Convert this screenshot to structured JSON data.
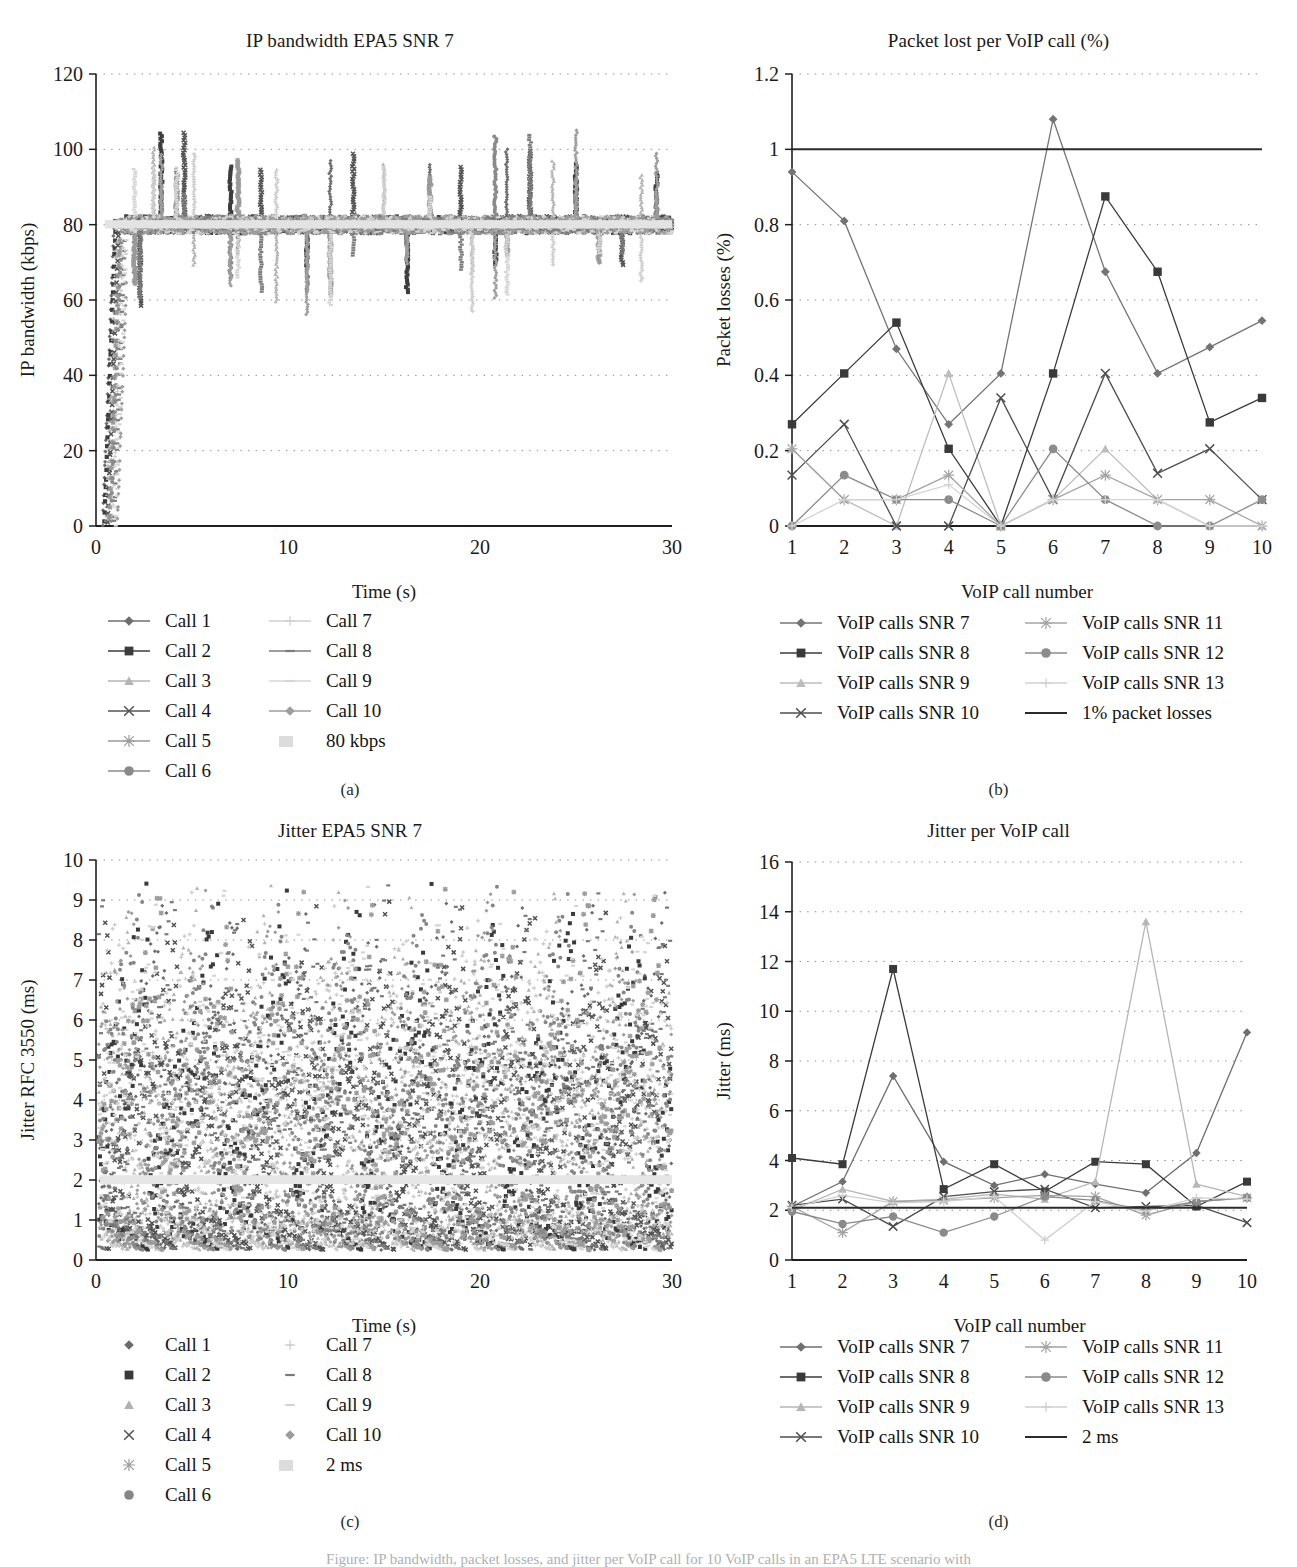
{
  "figure": {
    "subcaptions": [
      "(a)",
      "(b)",
      "(c)",
      "(d)"
    ],
    "bottom_caption": "Figure: IP bandwidth, packet losses, and jitter per VoIP call for 10 VoIP calls in an EPA5 LTE scenario with"
  },
  "chart_data": [
    {
      "id": "a",
      "type": "scatter",
      "title": "IP bandwidth EPA5 SNR 7",
      "xlabel": "Time (s)",
      "ylabel": "IP bandwidth (kbps)",
      "xlim": [
        0,
        30
      ],
      "ylim": [
        0,
        120
      ],
      "xticks": [
        0,
        10,
        20,
        30
      ],
      "yticks": [
        0,
        20,
        40,
        60,
        80,
        100,
        120
      ],
      "grid": "horizontal-dotted",
      "reference_value": 80,
      "reference_label": "80 kbps",
      "nominal_band": [
        78,
        82
      ],
      "series": [
        {
          "name": "Call 1",
          "marker": "diamond",
          "color": "#6e6e6e"
        },
        {
          "name": "Call 2",
          "marker": "square",
          "color": "#3d3d3d"
        },
        {
          "name": "Call 3",
          "marker": "triangle",
          "color": "#b4b4b4"
        },
        {
          "name": "Call 4",
          "marker": "x",
          "color": "#555555"
        },
        {
          "name": "Call 5",
          "marker": "star",
          "color": "#9a9a9a"
        },
        {
          "name": "Call 6",
          "marker": "circle",
          "color": "#8a8a8a"
        },
        {
          "name": "Call 7",
          "marker": "plus",
          "color": "#cfcfcf"
        },
        {
          "name": "Call 8",
          "marker": "dash",
          "color": "#7d7d7d"
        },
        {
          "name": "Call 9",
          "marker": "dash",
          "color": "#d6d6d6"
        },
        {
          "name": "Call 10",
          "marker": "diamond",
          "color": "#9e9e9e"
        },
        {
          "name": "80 kbps",
          "marker": "band",
          "color": "#e2e2e2"
        }
      ],
      "legend_labels": [
        "Call 1",
        "Call 2",
        "Call 3",
        "Call 4",
        "Call 5",
        "Call 6",
        "Call 7",
        "Call 8",
        "Call 9",
        "Call 10",
        "80 kbps"
      ]
    },
    {
      "id": "b",
      "type": "line",
      "title": "Packet lost per VoIP call (%)",
      "xlabel": "VoIP call number",
      "ylabel": "Packet losses  (%)",
      "categories": [
        1,
        2,
        3,
        4,
        5,
        6,
        7,
        8,
        9,
        10
      ],
      "xlim": [
        1,
        10
      ],
      "ylim": [
        0,
        1.2
      ],
      "yticks": [
        0,
        0.2,
        0.4,
        0.6,
        0.8,
        1,
        1.2
      ],
      "grid": "horizontal-dotted",
      "threshold": {
        "value": 1,
        "label": "1% packet losses",
        "color": "#2b2b2b"
      },
      "series": [
        {
          "name": "VoIP calls SNR 7",
          "marker": "diamond",
          "color": "#747474",
          "values": [
            0.94,
            0.81,
            0.47,
            0.27,
            0.405,
            1.08,
            0.675,
            0.405,
            0.475,
            0.545
          ]
        },
        {
          "name": "VoIP calls SNR 8",
          "marker": "square",
          "color": "#3a3a3a",
          "values": [
            0.27,
            0.405,
            0.54,
            0.205,
            0.0,
            0.405,
            0.875,
            0.675,
            0.275,
            0.34
          ]
        },
        {
          "name": "VoIP calls SNR 9",
          "marker": "triangle",
          "color": "#bdbdbd",
          "values": [
            0.205,
            0.07,
            0.0,
            0.405,
            0.0,
            0.07,
            0.205,
            0.07,
            0.0,
            0.0
          ]
        },
        {
          "name": "VoIP calls SNR 10",
          "marker": "x",
          "color": "#4f4f4f",
          "values": [
            0.135,
            0.27,
            0.0,
            0.0,
            0.34,
            0.07,
            0.405,
            0.14,
            0.205,
            0.07
          ]
        },
        {
          "name": "VoIP calls SNR 11",
          "marker": "star",
          "color": "#a4a4a4",
          "values": [
            0.205,
            0.07,
            0.07,
            0.135,
            0.0,
            0.07,
            0.135,
            0.07,
            0.07,
            0.0
          ]
        },
        {
          "name": "VoIP calls SNR 12",
          "marker": "circle",
          "color": "#8c8c8c",
          "values": [
            0.0,
            0.135,
            0.07,
            0.07,
            0.0,
            0.205,
            0.07,
            0.0,
            0.0,
            0.07
          ]
        },
        {
          "name": "VoIP calls SNR 13",
          "marker": "plus",
          "color": "#d2d2d2",
          "values": [
            0.0,
            0.07,
            0.07,
            0.11,
            0.0,
            0.07,
            0.07,
            0.07,
            0.0,
            0.0
          ]
        }
      ],
      "legend_labels": [
        "VoIP calls SNR 7",
        "VoIP calls SNR 8",
        "VoIP calls SNR 9",
        "VoIP calls SNR 10",
        "VoIP calls SNR 11",
        "VoIP calls SNR 12",
        "VoIP calls SNR 13",
        "1% packet losses"
      ]
    },
    {
      "id": "c",
      "type": "scatter",
      "title": "Jitter EPA5 SNR 7",
      "xlabel": "Time (s)",
      "ylabel": "Jitter RFC 3550 (ms)",
      "xlim": [
        0,
        30
      ],
      "ylim": [
        0,
        10
      ],
      "xticks": [
        0,
        10,
        20,
        30
      ],
      "yticks": [
        0,
        1,
        2,
        3,
        4,
        5,
        6,
        7,
        8,
        9,
        10
      ],
      "grid": "horizontal-dotted",
      "reference_value": 2,
      "reference_label": "2 ms",
      "series": [
        {
          "name": "Call 1",
          "marker": "diamond",
          "color": "#6b6b6b"
        },
        {
          "name": "Call 2",
          "marker": "square",
          "color": "#3a3a3a"
        },
        {
          "name": "Call 3",
          "marker": "triangle",
          "color": "#b0b0b0"
        },
        {
          "name": "Call 4",
          "marker": "x",
          "color": "#505050"
        },
        {
          "name": "Call 5",
          "marker": "star",
          "color": "#9c9c9c"
        },
        {
          "name": "Call 6",
          "marker": "circle",
          "color": "#868686"
        },
        {
          "name": "Call 7",
          "marker": "plus",
          "color": "#cccccc"
        },
        {
          "name": "Call 8",
          "marker": "dash",
          "color": "#7a7a7a"
        },
        {
          "name": "Call 9",
          "marker": "dash",
          "color": "#d4d4d4"
        },
        {
          "name": "Call 10",
          "marker": "diamond",
          "color": "#9b9b9b"
        },
        {
          "name": "2 ms",
          "marker": "band",
          "color": "#e4e4e4"
        }
      ],
      "legend_labels": [
        "Call 1",
        "Call 2",
        "Call 3",
        "Call 4",
        "Call 5",
        "Call 6",
        "Call 7",
        "Call 8",
        "Call 9",
        "Call 10",
        "2 ms"
      ]
    },
    {
      "id": "d",
      "type": "line",
      "title": "Jitter per VoIP call",
      "xlabel": "VoIP call number",
      "ylabel": "Jitter (ms)",
      "categories": [
        1,
        2,
        3,
        4,
        5,
        6,
        7,
        8,
        9,
        10
      ],
      "xlim": [
        1,
        10
      ],
      "ylim": [
        0,
        16
      ],
      "yticks": [
        0,
        2,
        4,
        6,
        8,
        10,
        12,
        14,
        16
      ],
      "grid": "horizontal-dotted",
      "threshold": {
        "value": 2.1,
        "label": "2 ms",
        "color": "#2b2b2b"
      },
      "series": [
        {
          "name": "VoIP calls SNR 7",
          "marker": "diamond",
          "color": "#6f6f6f",
          "values": [
            2.15,
            3.15,
            7.4,
            3.95,
            3.0,
            3.45,
            3.05,
            2.7,
            4.3,
            9.15
          ]
        },
        {
          "name": "VoIP calls SNR 8",
          "marker": "square",
          "color": "#3a3a3a",
          "values": [
            4.1,
            3.85,
            11.7,
            2.85,
            3.85,
            2.75,
            3.95,
            3.85,
            2.15,
            3.15
          ]
        },
        {
          "name": "VoIP calls SNR 9",
          "marker": "triangle",
          "color": "#b6b6b6",
          "values": [
            2.0,
            2.85,
            2.35,
            2.45,
            2.65,
            2.45,
            3.15,
            13.6,
            3.05,
            2.55
          ]
        },
        {
          "name": "VoIP calls SNR 10",
          "marker": "x",
          "color": "#4d4d4d",
          "values": [
            2.2,
            2.45,
            1.35,
            2.55,
            2.75,
            2.85,
            2.1,
            2.15,
            2.2,
            1.5
          ]
        },
        {
          "name": "VoIP calls SNR 11",
          "marker": "star",
          "color": "#a2a2a2",
          "values": [
            2.15,
            1.1,
            2.35,
            2.4,
            2.5,
            2.6,
            2.55,
            1.8,
            2.35,
            2.5
          ]
        },
        {
          "name": "VoIP calls SNR 12",
          "marker": "circle",
          "color": "#8a8a8a",
          "values": [
            1.95,
            1.45,
            1.75,
            1.1,
            1.75,
            2.55,
            2.4,
            2.0,
            2.35,
            2.5
          ]
        },
        {
          "name": "VoIP calls SNR 13",
          "marker": "plus",
          "color": "#cfcfcf",
          "values": [
            2.1,
            2.6,
            2.3,
            2.35,
            2.55,
            0.8,
            2.35,
            1.95,
            2.5,
            2.45
          ]
        }
      ],
      "legend_labels": [
        "VoIP calls SNR 7",
        "VoIP calls SNR 8",
        "VoIP calls SNR 9",
        "VoIP calls SNR 10",
        "VoIP calls SNR 11",
        "VoIP calls SNR 12",
        "VoIP calls SNR 13",
        "2 ms"
      ]
    }
  ]
}
